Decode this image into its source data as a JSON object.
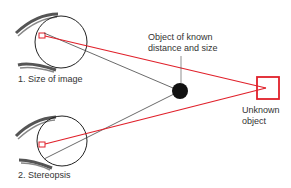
{
  "labels": {
    "known_object": [
      "Object of known",
      "distance and size"
    ],
    "unknown_object": [
      "Unknown",
      "object"
    ],
    "eye1": "1. Size of image",
    "eye2": "2. Stereopsis"
  },
  "colors": {
    "red": "#e0202a",
    "line": "#444444",
    "dot": "#111111"
  }
}
